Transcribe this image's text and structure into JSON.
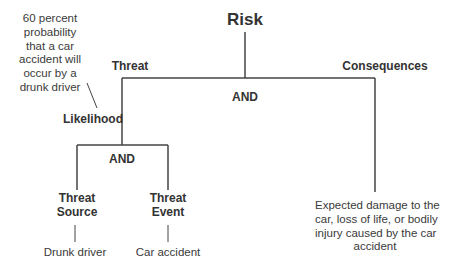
{
  "diagram": {
    "root": "Risk",
    "threat_label": "Threat",
    "consequences_label": "Consequences",
    "top_gate": "AND",
    "likelihood_label": "Likelihood",
    "sub_gate": "AND",
    "threat_source": {
      "line1": "Threat",
      "line2": "Source"
    },
    "threat_event": {
      "line1": "Threat",
      "line2": "Event"
    },
    "threat_source_example": "Drunk driver",
    "threat_event_example": "Car accident",
    "likelihood_note": [
      "60 percent",
      "probability",
      "that a car",
      "accident will",
      "occur by a",
      "drunk driver"
    ],
    "consequences_note": [
      "Expected damage to the",
      "car, loss of life, or bodily",
      "injury caused by the car",
      "accident"
    ]
  }
}
